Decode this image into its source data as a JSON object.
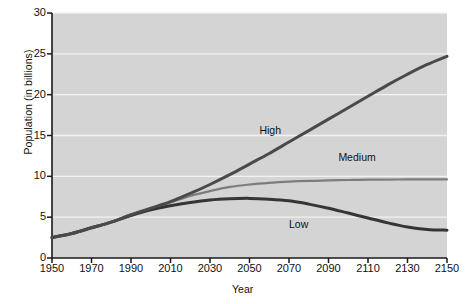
{
  "chart_data": {
    "type": "line",
    "title": "",
    "xlabel": "Year",
    "ylabel": "Population (in billions)",
    "xlim": [
      1950,
      2150
    ],
    "ylim": [
      0,
      30
    ],
    "grid": true,
    "grid_axis": "y",
    "legend_position": "inline-annotations",
    "xticks": [
      1950,
      1970,
      1990,
      2010,
      2030,
      2050,
      2070,
      2090,
      2110,
      2130,
      2150
    ],
    "yticks": [
      0,
      5,
      10,
      15,
      20,
      25,
      30
    ],
    "xtick_labels": [
      "1950",
      "1970",
      "1990",
      "2010",
      "2030",
      "2050",
      "2070",
      "2090",
      "2110",
      "2130",
      "2150"
    ],
    "ytick_labels": [
      "0",
      "5",
      "10",
      "15",
      "20",
      "25",
      "30"
    ],
    "plot_background": "#d4d4d4",
    "gridline_color": "#f2f2f2",
    "x": [
      1950,
      1960,
      1970,
      1980,
      1990,
      2000,
      2010,
      2020,
      2030,
      2040,
      2050,
      2060,
      2070,
      2080,
      2090,
      2100,
      2110,
      2120,
      2130,
      2140,
      2150
    ],
    "series": [
      {
        "name": "High",
        "color": "#4a4a4a",
        "width": 3.0,
        "values": [
          2.5,
          3.0,
          3.7,
          4.4,
          5.3,
          6.1,
          6.9,
          7.9,
          9.0,
          10.2,
          11.5,
          12.8,
          14.2,
          15.6,
          17.0,
          18.4,
          19.8,
          21.2,
          22.5,
          23.7,
          24.7
        ],
        "label_x": 2055,
        "label_y": 15.6
      },
      {
        "name": "Medium",
        "color": "#7d7d7d",
        "width": 2.2,
        "values": [
          2.5,
          3.0,
          3.7,
          4.4,
          5.3,
          6.1,
          6.8,
          7.6,
          8.2,
          8.7,
          9.0,
          9.2,
          9.35,
          9.45,
          9.5,
          9.55,
          9.6,
          9.6,
          9.62,
          9.62,
          9.62
        ],
        "label_x": 2095,
        "label_y": 12.3
      },
      {
        "name": "Low",
        "color": "#353535",
        "width": 3.0,
        "values": [
          2.5,
          3.0,
          3.7,
          4.4,
          5.2,
          5.9,
          6.4,
          6.8,
          7.1,
          7.25,
          7.3,
          7.2,
          7.0,
          6.6,
          6.1,
          5.5,
          4.9,
          4.3,
          3.8,
          3.5,
          3.4
        ],
        "label_x": 2070,
        "label_y": 4.0
      }
    ]
  }
}
